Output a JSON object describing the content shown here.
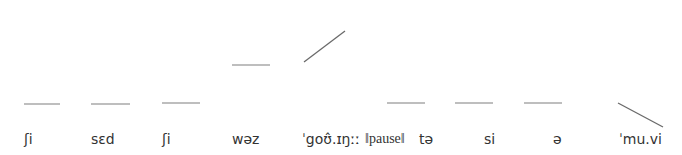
{
  "diagram": {
    "type": "intonation-contour",
    "line_color": "#8a8a8a",
    "text_color": "#333333",
    "syllables": [
      {
        "text": "ʃi",
        "x": 24,
        "contour": {
          "shape": "level",
          "x1": 24,
          "y1": 104,
          "x2": 60,
          "y2": 104
        }
      },
      {
        "text": "sɛd",
        "x": 91,
        "contour": {
          "shape": "level",
          "x1": 91,
          "y1": 104,
          "x2": 130,
          "y2": 104
        }
      },
      {
        "text": "ʃi",
        "x": 162,
        "contour": {
          "shape": "level",
          "x1": 162,
          "y1": 103,
          "x2": 200,
          "y2": 103
        }
      },
      {
        "text": "wəz",
        "x": 232,
        "contour": {
          "shape": "level",
          "x1": 232,
          "y1": 65,
          "x2": 270,
          "y2": 65
        }
      },
      {
        "text": "ˈgoʊ̂.ɪŋːː",
        "x": 302,
        "contour": {
          "shape": "rising",
          "x1": 304,
          "y1": 62,
          "x2": 345,
          "y2": 31
        }
      },
      {
        "text": "‖pause‖",
        "x": 365,
        "pause": true
      },
      {
        "text": "tə",
        "x": 419,
        "contour": {
          "shape": "level",
          "x1": 387,
          "y1": 103,
          "x2": 425,
          "y2": 103
        }
      },
      {
        "text": "si",
        "x": 484,
        "contour": {
          "shape": "level",
          "x1": 455,
          "y1": 103,
          "x2": 493,
          "y2": 103
        }
      },
      {
        "text": "ə",
        "x": 553,
        "contour": {
          "shape": "level",
          "x1": 524,
          "y1": 103,
          "x2": 562,
          "y2": 103
        }
      },
      {
        "text": "ˈmu.vi",
        "x": 619,
        "contour": {
          "shape": "falling",
          "x1": 618,
          "y1": 103,
          "x2": 663,
          "y2": 127
        }
      }
    ]
  }
}
